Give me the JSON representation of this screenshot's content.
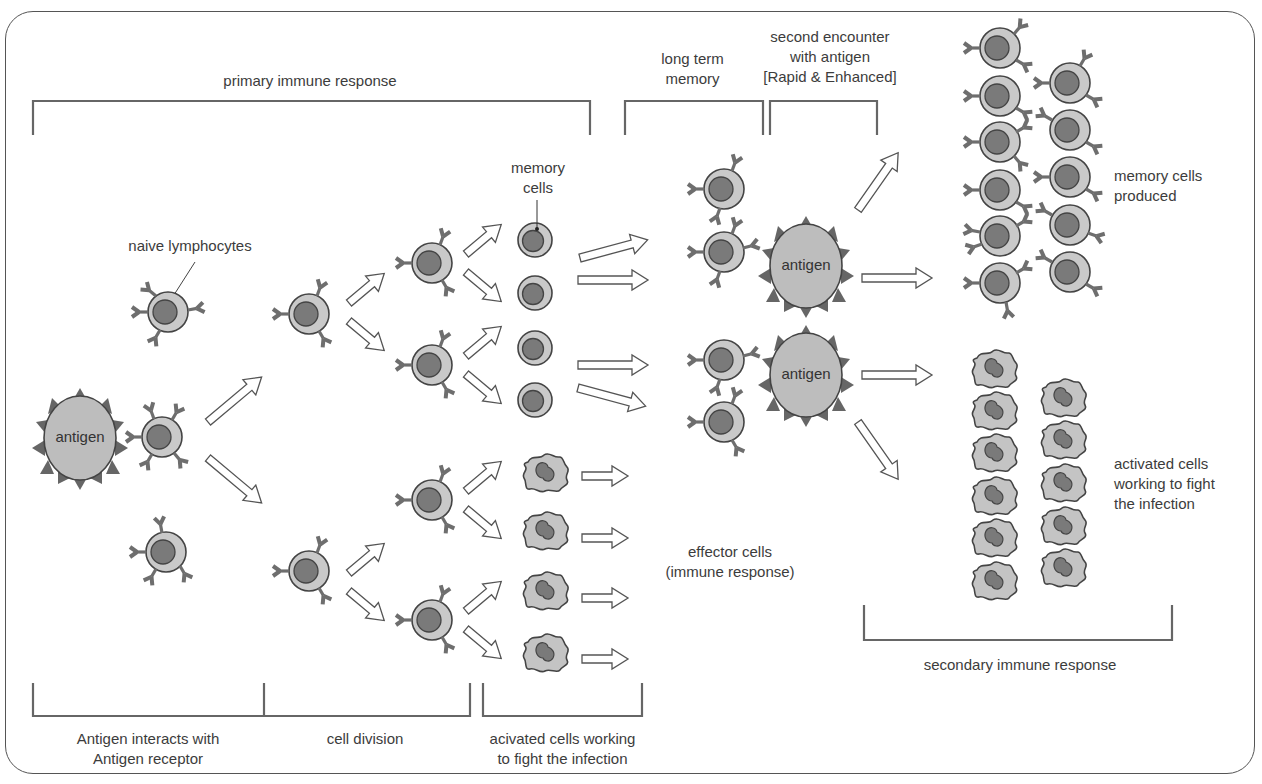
{
  "diagram": {
    "top_brackets": {
      "primary": "primary immune response",
      "long_term_memory": [
        "long term",
        "memory"
      ],
      "second_encounter": [
        "second encounter",
        "with antigen",
        "[Rapid & Enhanced]"
      ]
    },
    "bottom_brackets": {
      "antigen_interacts": [
        "Antigen interacts with",
        "Antigen receptor"
      ],
      "cell_division": "cell division",
      "activated_cells": [
        "acivated cells working",
        "to fight the infection"
      ],
      "secondary": "secondary immune response"
    },
    "callouts": {
      "naive_lymphocytes": "naive lymphocytes",
      "memory_cells": [
        "memory",
        "cells"
      ],
      "effector_cells": [
        "effector cells",
        "(immune response)"
      ],
      "memory_cells_produced": [
        "memory cells",
        "produced"
      ],
      "activated_cells_right": [
        "activated cells",
        "working to fight",
        "the infection"
      ]
    },
    "antigen_label": "antigen",
    "colors": {
      "cell_body": "#c8c8c8",
      "nucleus": "#7a7a7a",
      "outline": "#444444",
      "receptor": "#6e6e6e",
      "antigen_body": "#bdbdbd",
      "spike": "#666666",
      "bracket": "#666666"
    }
  }
}
